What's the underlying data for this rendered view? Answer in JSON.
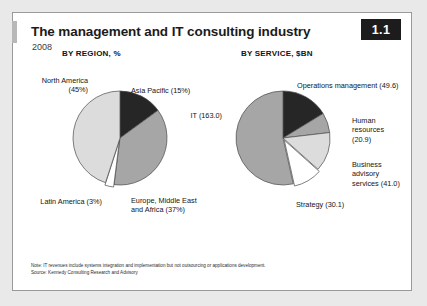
{
  "header": {
    "title": "The management and IT consulting industry",
    "subtitle": "2008",
    "badge": "1.1"
  },
  "footnote": {
    "note": "Note: IT revenues include systems integration and implementation but not outsourcing or applications development.",
    "source": "Source: Kennedy Consulting Research and Advisory"
  },
  "colors": {
    "dark": "#262626",
    "mid": "#a6a6a6",
    "light": "#dcdcdc",
    "white": "#ffffff",
    "outline": "#4a4a4a",
    "badge_bg": "#1c1c1c",
    "card_bg": "#ffffff",
    "page_bg": "#e9e9e9"
  },
  "chart_data": [
    {
      "type": "pie",
      "title": "BY REGION, %",
      "unit": "%",
      "categories": [
        "Asia Pacific",
        "Europe, Middle East and Africa",
        "Latin America",
        "North America"
      ],
      "values": [
        15,
        37,
        3,
        45
      ],
      "labels": [
        "Asia Pacific (15%)",
        "Europe, Middle East\nand Africa (37%)",
        "Latin America (3%)",
        "North America\n(45%)"
      ],
      "slice_colors": [
        "#262626",
        "#a6a6a6",
        "#ffffff",
        "#dcdcdc"
      ],
      "start_angle": 0,
      "direction": "clockwise",
      "legend": "none"
    },
    {
      "type": "pie",
      "title": "BY SERVICE, $BN",
      "unit": "$bn",
      "categories": [
        "Operations management",
        "Human resources",
        "Business advisory services",
        "Strategy",
        "IT"
      ],
      "values": [
        49.6,
        20.9,
        41.0,
        30.1,
        163.0
      ],
      "labels": [
        "Operations management (49.6)",
        "Human\nresources\n(20.9)",
        "Business\nadvisory\nservices (41.0)",
        "Strategy (30.1)",
        "IT (163.0)"
      ],
      "slice_colors": [
        "#262626",
        "#a6a6a6",
        "#dcdcdc",
        "#ffffff",
        "#a6a6a6"
      ],
      "start_angle": 0,
      "direction": "clockwise",
      "legend": "none"
    }
  ],
  "labels": {
    "region": {
      "north_america": "North America\n(45%)",
      "asia_pacific": "Asia Pacific (15%)",
      "emea": "Europe, Middle East\nand Africa (37%)",
      "latin_america": "Latin America (3%)"
    },
    "service": {
      "it": "IT (163.0)",
      "operations": "Operations management (49.6)",
      "human_resources": "Human\nresources\n(20.9)",
      "business_advisory": "Business\nadvisory\nservices (41.0)",
      "strategy": "Strategy (30.1)"
    }
  }
}
